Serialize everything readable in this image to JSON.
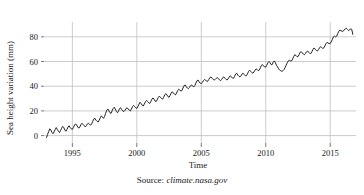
{
  "figure": {
    "source_prefix": "Source:",
    "source_url": "climate.nasa.gov"
  },
  "colors": {
    "line": "#222222",
    "grid": "#bfbfbf",
    "axis": "#555555",
    "text": "#1a1a1a",
    "background": "#ffffff"
  },
  "chart_data": {
    "type": "line",
    "title": "",
    "xlabel": "Time",
    "ylabel": "Sea height variation (mm)",
    "xlim": [
      1992.8,
      2017.0
    ],
    "ylim": [
      -6,
      92
    ],
    "xticks": [
      1995,
      2000,
      2005,
      2010,
      2015
    ],
    "xtick_labels": [
      "1995",
      "2000",
      "2005",
      "2010",
      "2015"
    ],
    "yticks": [
      0,
      20,
      40,
      60,
      80
    ],
    "ytick_labels": [
      "0",
      "20",
      "40",
      "60",
      "80"
    ],
    "grid": true,
    "legend": null,
    "series": [
      {
        "name": "Sea height variation",
        "x": [
          1993.0,
          1993.08,
          1993.17,
          1993.25,
          1993.33,
          1993.42,
          1993.5,
          1993.58,
          1993.67,
          1993.75,
          1993.83,
          1993.92,
          1994.0,
          1994.08,
          1994.17,
          1994.25,
          1994.33,
          1994.42,
          1994.5,
          1994.58,
          1994.67,
          1994.75,
          1994.83,
          1994.92,
          1995.0,
          1995.08,
          1995.17,
          1995.25,
          1995.33,
          1995.42,
          1995.5,
          1995.58,
          1995.67,
          1995.75,
          1995.83,
          1995.92,
          1996.0,
          1996.08,
          1996.17,
          1996.25,
          1996.33,
          1996.42,
          1996.5,
          1996.58,
          1996.67,
          1996.75,
          1996.83,
          1996.92,
          1997.0,
          1997.08,
          1997.17,
          1997.25,
          1997.33,
          1997.42,
          1997.5,
          1997.58,
          1997.67,
          1997.75,
          1997.83,
          1997.92,
          1998.0,
          1998.08,
          1998.17,
          1998.25,
          1998.33,
          1998.42,
          1998.5,
          1998.58,
          1998.67,
          1998.75,
          1998.83,
          1998.92,
          1999.0,
          1999.08,
          1999.17,
          1999.25,
          1999.33,
          1999.42,
          1999.5,
          1999.58,
          1999.67,
          1999.75,
          1999.83,
          1999.92,
          2000.0,
          2000.08,
          2000.17,
          2000.25,
          2000.33,
          2000.42,
          2000.5,
          2000.58,
          2000.67,
          2000.75,
          2000.83,
          2000.92,
          2001.0,
          2001.08,
          2001.17,
          2001.25,
          2001.33,
          2001.42,
          2001.5,
          2001.58,
          2001.67,
          2001.75,
          2001.83,
          2001.92,
          2002.0,
          2002.08,
          2002.17,
          2002.25,
          2002.33,
          2002.42,
          2002.5,
          2002.58,
          2002.67,
          2002.75,
          2002.83,
          2002.92,
          2003.0,
          2003.08,
          2003.17,
          2003.25,
          2003.33,
          2003.42,
          2003.5,
          2003.58,
          2003.67,
          2003.75,
          2003.83,
          2003.92,
          2004.0,
          2004.08,
          2004.17,
          2004.25,
          2004.33,
          2004.42,
          2004.5,
          2004.58,
          2004.67,
          2004.75,
          2004.83,
          2004.92,
          2005.0,
          2005.08,
          2005.17,
          2005.25,
          2005.33,
          2005.42,
          2005.5,
          2005.58,
          2005.67,
          2005.75,
          2005.83,
          2005.92,
          2006.0,
          2006.08,
          2006.17,
          2006.25,
          2006.33,
          2006.42,
          2006.5,
          2006.58,
          2006.67,
          2006.75,
          2006.83,
          2006.92,
          2007.0,
          2007.08,
          2007.17,
          2007.25,
          2007.33,
          2007.42,
          2007.5,
          2007.58,
          2007.67,
          2007.75,
          2007.83,
          2007.92,
          2008.0,
          2008.08,
          2008.17,
          2008.25,
          2008.33,
          2008.42,
          2008.5,
          2008.58,
          2008.67,
          2008.75,
          2008.83,
          2008.92,
          2009.0,
          2009.08,
          2009.17,
          2009.25,
          2009.33,
          2009.42,
          2009.5,
          2009.58,
          2009.67,
          2009.75,
          2009.83,
          2009.92,
          2010.0,
          2010.08,
          2010.17,
          2010.25,
          2010.33,
          2010.42,
          2010.5,
          2010.58,
          2010.67,
          2010.75,
          2010.83,
          2010.92,
          2011.0,
          2011.08,
          2011.17,
          2011.25,
          2011.33,
          2011.42,
          2011.5,
          2011.58,
          2011.67,
          2011.75,
          2011.83,
          2011.92,
          2012.0,
          2012.08,
          2012.17,
          2012.25,
          2012.33,
          2012.42,
          2012.5,
          2012.58,
          2012.67,
          2012.75,
          2012.83,
          2012.92,
          2013.0,
          2013.08,
          2013.17,
          2013.25,
          2013.33,
          2013.42,
          2013.5,
          2013.58,
          2013.67,
          2013.75,
          2013.83,
          2013.92,
          2014.0,
          2014.08,
          2014.17,
          2014.25,
          2014.33,
          2014.42,
          2014.5,
          2014.58,
          2014.67,
          2014.75,
          2014.83,
          2014.92,
          2015.0,
          2015.08,
          2015.17,
          2015.25,
          2015.33,
          2015.42,
          2015.5,
          2015.58,
          2015.67,
          2015.75,
          2015.83,
          2015.92,
          2016.0,
          2016.08,
          2016.17,
          2016.25,
          2016.33,
          2016.42,
          2016.5,
          2016.58,
          2016.67,
          2016.75
        ],
        "y": [
          -1.5,
          1.0,
          3.5,
          5.5,
          4.5,
          2.5,
          1.5,
          3.0,
          5.0,
          6.5,
          5.0,
          3.5,
          2.5,
          4.0,
          6.0,
          7.5,
          6.5,
          4.5,
          3.5,
          5.0,
          7.0,
          8.0,
          6.5,
          5.5,
          5.0,
          6.5,
          8.5,
          9.5,
          8.5,
          7.0,
          6.0,
          7.0,
          9.0,
          10.0,
          9.0,
          8.0,
          7.0,
          8.0,
          9.5,
          10.0,
          9.0,
          8.5,
          9.5,
          11.5,
          13.5,
          14.0,
          12.5,
          11.5,
          11.0,
          12.5,
          14.5,
          16.0,
          15.0,
          14.0,
          15.5,
          18.0,
          20.5,
          21.5,
          20.0,
          18.5,
          18.0,
          20.0,
          22.0,
          23.0,
          21.5,
          19.5,
          18.5,
          20.0,
          22.0,
          22.5,
          21.0,
          20.0,
          19.5,
          20.5,
          22.0,
          22.5,
          21.5,
          20.5,
          20.0,
          21.5,
          23.5,
          24.5,
          23.5,
          22.5,
          22.0,
          23.5,
          25.5,
          27.0,
          26.0,
          24.5,
          24.0,
          25.5,
          27.5,
          28.5,
          27.5,
          26.5,
          26.0,
          27.5,
          29.5,
          30.5,
          29.5,
          28.0,
          27.5,
          29.0,
          31.0,
          32.0,
          31.0,
          30.0,
          29.5,
          31.0,
          33.0,
          34.0,
          33.0,
          31.5,
          31.0,
          32.5,
          34.5,
          35.5,
          34.5,
          33.5,
          33.0,
          34.5,
          36.5,
          37.5,
          37.0,
          36.0,
          36.5,
          38.5,
          40.5,
          41.0,
          39.5,
          38.5,
          38.0,
          39.0,
          40.5,
          41.0,
          40.0,
          39.5,
          40.5,
          42.5,
          44.5,
          45.0,
          43.5,
          42.5,
          42.0,
          43.0,
          44.5,
          45.5,
          45.0,
          44.0,
          44.0,
          45.5,
          47.0,
          47.5,
          46.5,
          45.5,
          45.0,
          45.5,
          46.5,
          47.0,
          46.0,
          45.0,
          44.5,
          45.5,
          47.0,
          47.5,
          46.5,
          45.5,
          45.0,
          46.0,
          47.5,
          48.5,
          47.5,
          46.5,
          46.5,
          48.0,
          50.0,
          50.5,
          49.0,
          48.0,
          47.5,
          48.5,
          50.0,
          50.5,
          49.5,
          48.5,
          48.5,
          50.0,
          52.0,
          53.0,
          52.0,
          51.0,
          50.5,
          51.5,
          53.0,
          54.0,
          53.5,
          52.5,
          53.0,
          55.0,
          57.0,
          57.5,
          56.5,
          55.5,
          55.5,
          57.0,
          59.0,
          60.0,
          59.0,
          57.5,
          57.5,
          59.5,
          60.5,
          59.0,
          57.0,
          55.5,
          54.0,
          53.0,
          52.5,
          52.0,
          52.5,
          53.5,
          55.0,
          57.0,
          59.0,
          60.5,
          61.0,
          60.5,
          60.5,
          62.0,
          64.0,
          65.5,
          65.0,
          64.0,
          64.0,
          65.5,
          67.5,
          68.0,
          67.0,
          66.0,
          65.5,
          66.5,
          68.0,
          68.5,
          67.5,
          66.5,
          66.5,
          68.0,
          70.0,
          71.0,
          70.0,
          69.0,
          68.5,
          69.5,
          71.0,
          72.0,
          71.5,
          70.5,
          71.0,
          72.5,
          74.5,
          75.5,
          75.0,
          74.5,
          74.5,
          76.0,
          78.0,
          80.0,
          80.5,
          80.0,
          80.5,
          82.5,
          84.5,
          85.5,
          85.0,
          84.5,
          84.5,
          85.5,
          86.5,
          87.0,
          86.0,
          85.0,
          85.5,
          86.5,
          86.0,
          82.0
        ]
      }
    ]
  }
}
